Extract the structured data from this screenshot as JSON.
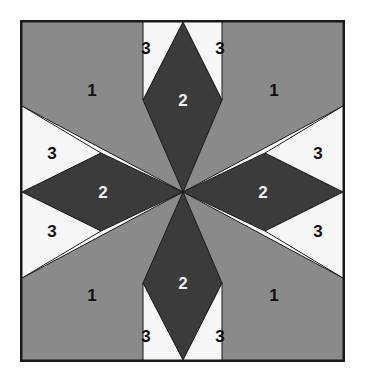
{
  "figure": {
    "frame": {
      "x": 20,
      "y": 20,
      "width": 325,
      "height": 342,
      "border_color": "#1a1a1a",
      "border_width": 2
    },
    "center": {
      "x": 183,
      "y": 192
    },
    "palette": {
      "gray": "#8a8a8a",
      "dark": "#3b3b3b",
      "light": "#f7f7f7",
      "outline": "#1a1a1a",
      "page_background": "#ffffff",
      "label_on_dark": "#f2f2f2",
      "label_on_light": "#101010"
    },
    "regions": [
      {
        "id": "corner-top-left",
        "label": "1",
        "fill": "gray",
        "label_color": "label_on_light",
        "label_x": 92,
        "label_y": 90,
        "points": "22,22 143,22 183,192 22,106"
      },
      {
        "id": "corner-top-right",
        "label": "1",
        "fill": "gray",
        "label_color": "label_on_light",
        "label_x": 274,
        "label_y": 90,
        "points": "343,22 343,106 183,192 222,22"
      },
      {
        "id": "corner-bottom-right",
        "label": "1",
        "fill": "gray",
        "label_color": "label_on_light",
        "label_x": 274,
        "label_y": 295,
        "points": "343,278 343,360 222,360 183,192"
      },
      {
        "id": "corner-bottom-left",
        "label": "1",
        "fill": "gray",
        "label_color": "label_on_light",
        "label_x": 92,
        "label_y": 295,
        "points": "22,278 183,192 143,360 22,360"
      },
      {
        "id": "diamond-north",
        "label": "2",
        "fill": "dark",
        "label_color": "label_on_dark",
        "label_x": 183,
        "label_y": 100,
        "points": "183,22 222,100 183,192 143,100"
      },
      {
        "id": "diamond-east",
        "label": "2",
        "fill": "dark",
        "label_color": "label_on_dark",
        "label_x": 263,
        "label_y": 192,
        "points": "343,192 265,231 183,192 265,153"
      },
      {
        "id": "diamond-south",
        "label": "2",
        "fill": "dark",
        "label_color": "label_on_dark",
        "label_x": 183,
        "label_y": 283,
        "points": "183,360 143,283 183,192 222,283"
      },
      {
        "id": "diamond-west",
        "label": "2",
        "fill": "dark",
        "label_color": "label_on_dark",
        "label_x": 103,
        "label_y": 192,
        "points": "22,192 101,153 183,192 101,231"
      },
      {
        "id": "triangle-top-left",
        "label": "3",
        "fill": "light",
        "label_color": "label_on_light",
        "label_x": 146,
        "label_y": 48,
        "points": "143,22 183,22 143,100"
      },
      {
        "id": "triangle-top-right",
        "label": "3",
        "fill": "light",
        "label_color": "label_on_light",
        "label_x": 220,
        "label_y": 48,
        "points": "183,22 222,22 222,100"
      },
      {
        "id": "triangle-right-top",
        "label": "3",
        "fill": "light",
        "label_color": "label_on_light",
        "label_x": 318,
        "label_y": 153,
        "points": "343,106 343,192 265,153"
      },
      {
        "id": "triangle-right-bottom",
        "label": "3",
        "fill": "light",
        "label_color": "label_on_light",
        "label_x": 318,
        "label_y": 231,
        "points": "343,192 343,278 265,231"
      },
      {
        "id": "triangle-bottom-right",
        "label": "3",
        "fill": "light",
        "label_color": "label_on_light",
        "label_x": 220,
        "label_y": 336,
        "points": "222,283 222,360 183,360"
      },
      {
        "id": "triangle-bottom-left",
        "label": "3",
        "fill": "light",
        "label_color": "label_on_light",
        "label_x": 146,
        "label_y": 336,
        "points": "143,283 183,360 143,360"
      },
      {
        "id": "triangle-left-bottom",
        "label": "3",
        "fill": "light",
        "label_color": "label_on_light",
        "label_x": 52,
        "label_y": 231,
        "points": "22,192 101,231 22,278"
      },
      {
        "id": "triangle-left-top",
        "label": "3",
        "fill": "light",
        "label_color": "label_on_light",
        "label_x": 52,
        "label_y": 153,
        "points": "22,106 101,153 22,192"
      }
    ],
    "legend": {
      "1": "gray corner triangle",
      "2": "dark diamond point",
      "3": "light background triangle"
    }
  }
}
